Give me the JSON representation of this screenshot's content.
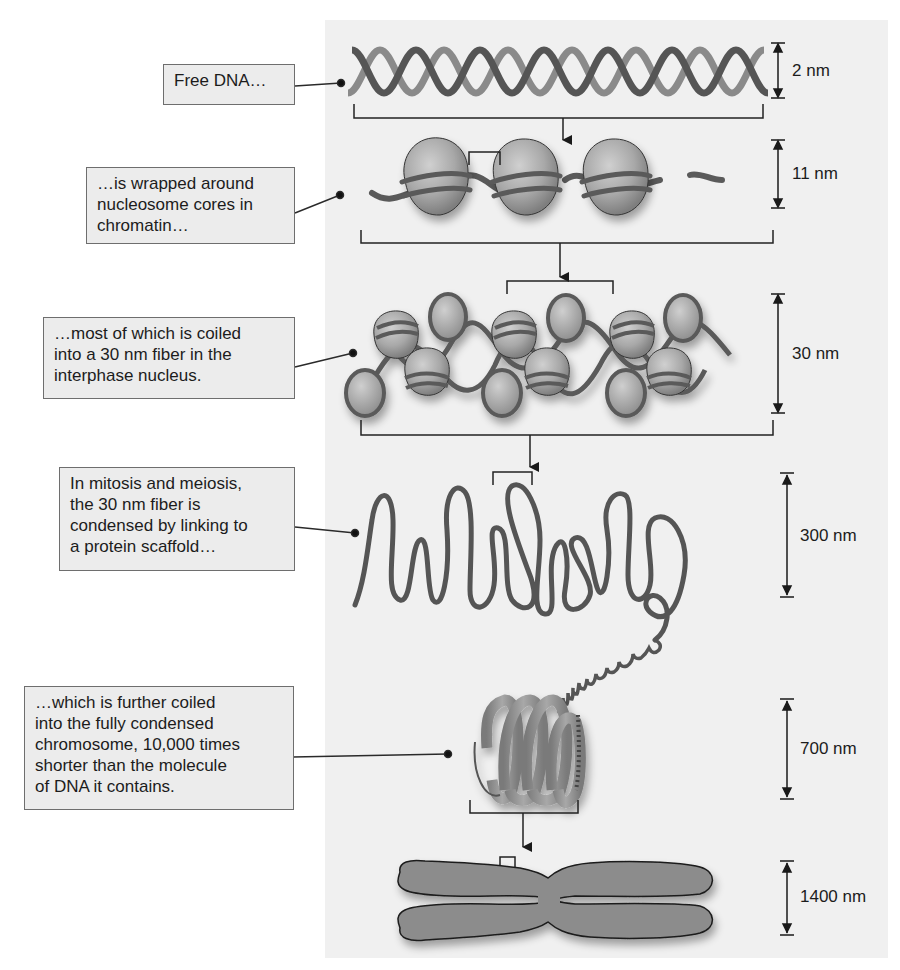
{
  "figure": {
    "colors": {
      "panel_background": "#f0f0f0",
      "callout_fill": "#ececec",
      "callout_border": "#6e6e6e",
      "dna_strand_dark": "#555555",
      "dna_strand_light": "#8a8a8a",
      "nucleosome_fill": "#a9a9a9",
      "fiber_stroke": "#5a5a5a",
      "chromosome_fill": "#8c8c8c"
    }
  },
  "stages": [
    {
      "id": "free-dna",
      "callout_lines": [
        "Free DNA…"
      ],
      "scale": "2 nm"
    },
    {
      "id": "nucleosome",
      "callout_lines": [
        "…is wrapped around",
        "nucleosome cores in",
        "chromatin…"
      ],
      "scale": "11 nm"
    },
    {
      "id": "30nm-fiber",
      "callout_lines": [
        "…most of which is coiled",
        "into a 30 nm fiber in the",
        "interphase nucleus."
      ],
      "scale": "30 nm"
    },
    {
      "id": "scaffold-loops",
      "callout_lines": [
        "In mitosis and meiosis,",
        "the 30 nm fiber is",
        "condensed by linking to",
        "a protein scaffold…"
      ],
      "scale": "300 nm"
    },
    {
      "id": "coiled-fiber",
      "callout_lines": [
        "…which is further coiled",
        "into the fully condensed",
        "chromosome, 10,000 times",
        "shorter than the molecule",
        "of DNA it contains."
      ],
      "scale": "700 nm"
    },
    {
      "id": "chromosome",
      "callout_lines": [],
      "scale": "1400 nm"
    }
  ]
}
